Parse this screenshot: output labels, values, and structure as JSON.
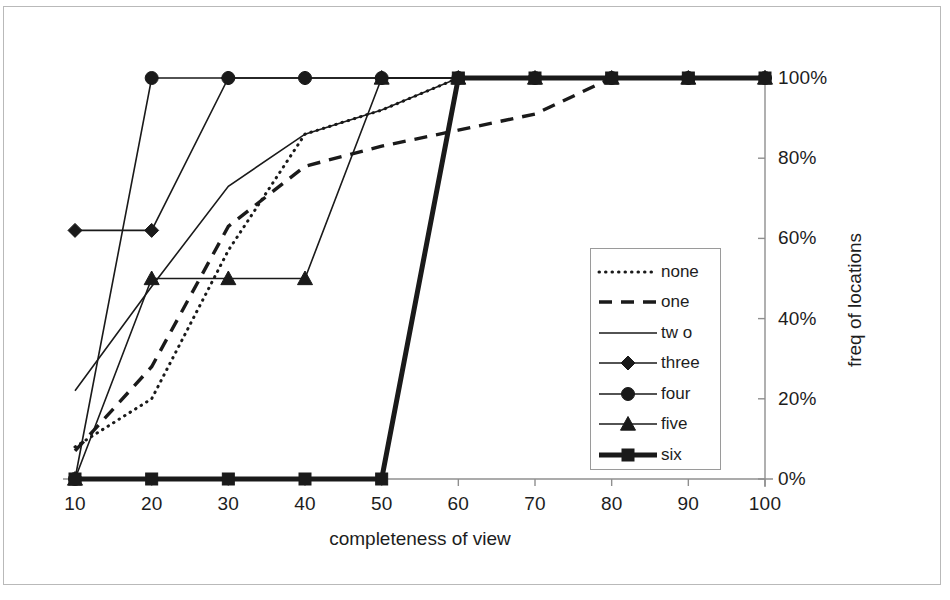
{
  "chart_data": {
    "type": "line",
    "title": "",
    "xlabel": "completeness of view",
    "ylabel": "freq of locations",
    "x": [
      10,
      20,
      30,
      40,
      50,
      60,
      70,
      80,
      90,
      100
    ],
    "xlim": [
      10,
      100
    ],
    "ylim": [
      0,
      100
    ],
    "xticks": [
      "10",
      "20",
      "30",
      "40",
      "50",
      "60",
      "70",
      "80",
      "90",
      "100"
    ],
    "yticks": [
      "0%",
      "20%",
      "40%",
      "60%",
      "80%",
      "100%"
    ],
    "ytick_values": [
      0,
      20,
      40,
      60,
      80,
      100
    ],
    "grid": false,
    "y_axis_position": "right",
    "legend_position": "inside-right-lower",
    "series": [
      {
        "name": "none",
        "style": "dotted",
        "marker": "none",
        "values": [
          8,
          20,
          57,
          86,
          92,
          100,
          100,
          100,
          100,
          100
        ]
      },
      {
        "name": "one",
        "style": "dashed",
        "marker": "none",
        "values": [
          7,
          28,
          63,
          78,
          83,
          87,
          91,
          100,
          100,
          100
        ]
      },
      {
        "name": "tw o",
        "style": "solid-thin",
        "marker": "none",
        "values": [
          22,
          48,
          73,
          86,
          92,
          100,
          100,
          100,
          100,
          100
        ]
      },
      {
        "name": "three",
        "style": "solid-thin",
        "marker": "diamond",
        "values": [
          62,
          62,
          100,
          100,
          100,
          100,
          100,
          100,
          100,
          100
        ]
      },
      {
        "name": "four",
        "style": "solid-thin",
        "marker": "circle",
        "values": [
          0,
          100,
          100,
          100,
          100,
          100,
          100,
          100,
          100,
          100
        ]
      },
      {
        "name": "five",
        "style": "solid-thin",
        "marker": "triangle",
        "values": [
          0,
          50,
          50,
          50,
          100,
          100,
          100,
          100,
          100,
          100
        ]
      },
      {
        "name": "six",
        "style": "solid-thick",
        "marker": "square",
        "values": [
          0,
          0,
          0,
          0,
          0,
          100,
          100,
          100,
          100,
          100
        ]
      }
    ]
  },
  "colors": {
    "line": "#1a1a1a",
    "axis": "#8f8f8f",
    "frame": "#b9b9b9",
    "background": "#ffffff"
  }
}
